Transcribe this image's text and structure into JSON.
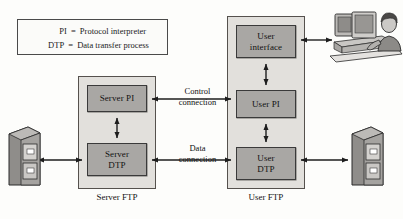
{
  "diagram": {
    "legend": {
      "rows": [
        {
          "abbr": "PI",
          "eq": "=",
          "definition": "Protocol interpreter"
        },
        {
          "abbr": "DTP",
          "eq": "=",
          "definition": "Data transfer process"
        }
      ]
    },
    "server_side": {
      "caption": "Server FTP",
      "components": [
        {
          "id": "server-pi",
          "label": "Server PI"
        },
        {
          "id": "server-dtp",
          "label": "Server\nDTP"
        }
      ],
      "storage_icon": "file-cabinet-icon"
    },
    "user_side": {
      "caption": "User FTP",
      "components": [
        {
          "id": "user-ui",
          "label": "User\ninterface"
        },
        {
          "id": "user-pi",
          "label": "User PI"
        },
        {
          "id": "user-dtp",
          "label": "User\nDTP"
        }
      ],
      "storage_icon": "file-cabinet-icon",
      "terminal_icon": "user-at-computer-icon"
    },
    "connections": [
      {
        "id": "control",
        "line1": "Control",
        "line2": "connection"
      },
      {
        "id": "data",
        "line1": "Data",
        "line2": "connection"
      }
    ],
    "colors": {
      "component_fill": "#a9a7a4",
      "container_fill": "#e2e0dc",
      "border": "#3a3a3a",
      "background": "#fdfdfb",
      "text": "#121212"
    }
  }
}
